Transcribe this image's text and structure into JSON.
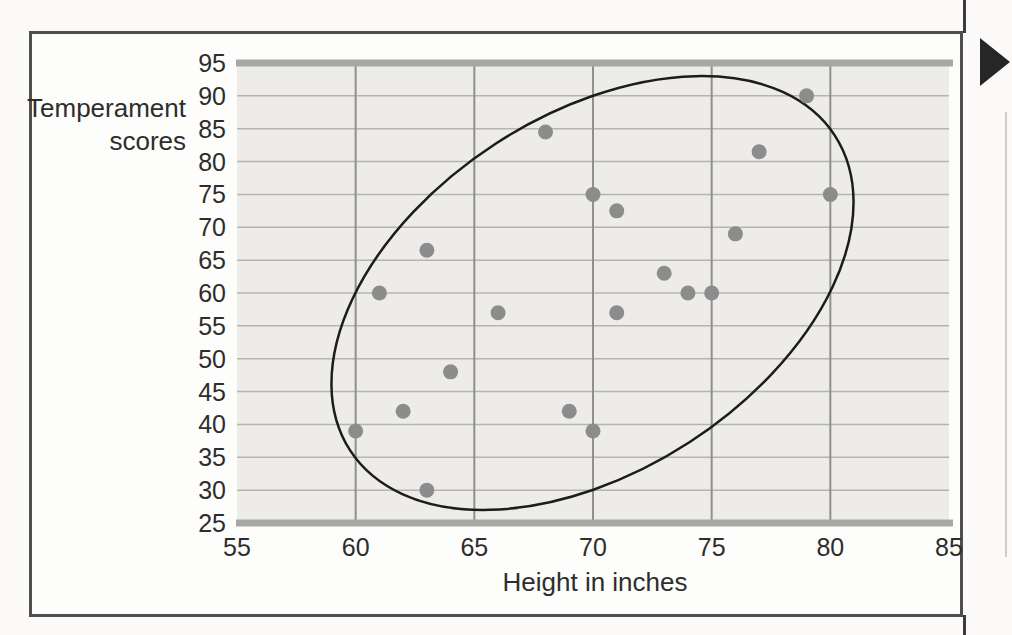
{
  "figure": {
    "ylabel_line1": "Temperament",
    "ylabel_line2": "scores",
    "xlabel": "Height in inches"
  },
  "chart_data": {
    "type": "scatter",
    "title": "",
    "xlabel": "Height in inches",
    "ylabel": "Temperament scores",
    "xlim": [
      55,
      85
    ],
    "ylim": [
      25,
      95
    ],
    "x_ticks": [
      55,
      60,
      65,
      70,
      75,
      80,
      85
    ],
    "y_ticks": [
      95,
      90,
      85,
      80,
      75,
      70,
      65,
      60,
      55,
      50,
      45,
      40,
      35,
      30,
      25
    ],
    "grid": true,
    "legend": "none",
    "points": [
      [
        60,
        39
      ],
      [
        61,
        60
      ],
      [
        62,
        42
      ],
      [
        63,
        30
      ],
      [
        63,
        66.5
      ],
      [
        64,
        48
      ],
      [
        66,
        57
      ],
      [
        68,
        84.5
      ],
      [
        69,
        42
      ],
      [
        70,
        39
      ],
      [
        70,
        75
      ],
      [
        71,
        57
      ],
      [
        71,
        72.5
      ],
      [
        73,
        63
      ],
      [
        74,
        60
      ],
      [
        75,
        60
      ],
      [
        76,
        69
      ],
      [
        77,
        81.5
      ],
      [
        79,
        90
      ],
      [
        80,
        75
      ]
    ],
    "annotations": [
      {
        "kind": "ellipse",
        "meaning": "envelope around the point cloud showing positive correlation",
        "approx_center": [
          69.5,
          60
        ],
        "approx_x_extent": [
          59,
          81
        ],
        "approx_y_extent": [
          27,
          93
        ],
        "tilt": "up-to-the-right"
      }
    ]
  },
  "colors": {
    "plot_bg": "#edece9",
    "grid_minor": "#b5b4b1",
    "grid_major": "#8f8f8d",
    "band": "#a7a7a4",
    "dot": "#8c8c8c",
    "ellipse": "#1c1c1c",
    "frame": "#4f4f4f",
    "text": "#2e2d2b",
    "arrow": "#262626"
  }
}
